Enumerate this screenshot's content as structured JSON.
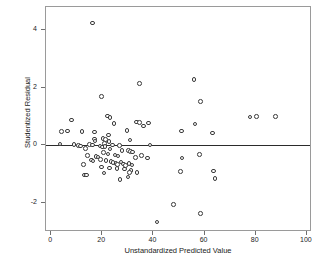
{
  "chart_data": {
    "type": "scatter",
    "title": "",
    "xlabel": "Unstandardized Predicted Value",
    "ylabel": "Studentized Residual",
    "xlim": [
      -2,
      102
    ],
    "ylim": [
      -3.0,
      4.8
    ],
    "xticks": [
      0,
      20,
      40,
      60,
      80,
      100
    ],
    "xtick_labels": [
      "0",
      "20",
      "40",
      "60",
      "80",
      "100"
    ],
    "yticks": [
      4,
      2,
      0,
      -2
    ],
    "ytick_labels": [
      "4",
      "2",
      "0",
      "-2"
    ],
    "grid": false,
    "legend": false,
    "reference_line": {
      "orientation": "horizontal",
      "y": 0
    },
    "marker": {
      "shape": "circle",
      "filled": false,
      "edge_color": "#3a3a3a",
      "size": 4.6
    },
    "frame_color": "#9a9a9a",
    "points": [
      [
        16.2,
        4.25
      ],
      [
        34.6,
        2.14
      ],
      [
        55.8,
        2.28
      ],
      [
        19.6,
        1.69
      ],
      [
        58.4,
        1.53
      ],
      [
        22.1,
        1.02
      ],
      [
        23.0,
        0.97
      ],
      [
        24.6,
        0.77
      ],
      [
        77.8,
        0.98
      ],
      [
        80.2,
        1.0
      ],
      [
        87.8,
        1.0
      ],
      [
        7.9,
        0.88
      ],
      [
        33.4,
        0.82
      ],
      [
        34.6,
        0.8
      ],
      [
        38.1,
        0.78
      ],
      [
        36.2,
        0.68
      ],
      [
        56.2,
        0.74
      ],
      [
        4.0,
        0.48
      ],
      [
        6.4,
        0.5
      ],
      [
        12.1,
        0.48
      ],
      [
        17.0,
        0.46
      ],
      [
        29.7,
        0.51
      ],
      [
        51.0,
        0.5
      ],
      [
        63.2,
        0.43
      ],
      [
        22.4,
        0.36
      ],
      [
        16.9,
        0.22
      ],
      [
        20.3,
        0.24
      ],
      [
        21.2,
        0.2
      ],
      [
        22.6,
        0.14
      ],
      [
        30.9,
        0.19
      ],
      [
        17.2,
        0.16
      ],
      [
        20.9,
        0.07
      ],
      [
        3.4,
        0.05
      ],
      [
        8.9,
        0.03
      ],
      [
        10.6,
        0.0
      ],
      [
        11.4,
        -0.02
      ],
      [
        14.9,
        0.04
      ],
      [
        16.1,
        0.02
      ],
      [
        19.1,
        -0.02
      ],
      [
        20.2,
        -0.05
      ],
      [
        21.0,
        -0.04
      ],
      [
        24.0,
        0.01
      ],
      [
        26.8,
        0.0
      ],
      [
        38.6,
        0.01
      ],
      [
        13.4,
        -0.1
      ],
      [
        23.1,
        -0.12
      ],
      [
        27.7,
        -0.18
      ],
      [
        30.2,
        -0.17
      ],
      [
        31.0,
        -0.2
      ],
      [
        31.8,
        -0.22
      ],
      [
        20.4,
        -0.25
      ],
      [
        22.2,
        -0.3
      ],
      [
        25.0,
        -0.33
      ],
      [
        26.2,
        -0.36
      ],
      [
        14.2,
        -0.34
      ],
      [
        17.6,
        -0.38
      ],
      [
        18.4,
        -0.4
      ],
      [
        33.0,
        -0.41
      ],
      [
        35.4,
        -0.35
      ],
      [
        37.8,
        -0.44
      ],
      [
        51.1,
        -0.44
      ],
      [
        58.0,
        -0.32
      ],
      [
        12.6,
        -0.66
      ],
      [
        15.8,
        -0.5
      ],
      [
        16.4,
        -0.54
      ],
      [
        19.2,
        -0.48
      ],
      [
        21.4,
        -0.52
      ],
      [
        23.4,
        -0.55
      ],
      [
        24.2,
        -0.6
      ],
      [
        25.4,
        -0.62
      ],
      [
        26.0,
        -0.66
      ],
      [
        27.4,
        -0.58
      ],
      [
        28.2,
        -0.64
      ],
      [
        29.0,
        -0.7
      ],
      [
        30.4,
        -0.63
      ],
      [
        31.6,
        -0.68
      ],
      [
        19.8,
        -0.74
      ],
      [
        22.8,
        -0.78
      ],
      [
        25.8,
        -0.8
      ],
      [
        28.8,
        -0.82
      ],
      [
        31.2,
        -0.86
      ],
      [
        20.6,
        -0.95
      ],
      [
        13.0,
        -1.02
      ],
      [
        13.9,
        -1.03
      ],
      [
        30.6,
        -0.94
      ],
      [
        33.6,
        -0.94
      ],
      [
        50.6,
        -0.9
      ],
      [
        63.4,
        -0.88
      ],
      [
        27.0,
        -1.18
      ],
      [
        30.0,
        -1.1
      ],
      [
        64.0,
        -1.15
      ],
      [
        47.9,
        -2.05
      ],
      [
        58.5,
        -2.36
      ],
      [
        41.4,
        -2.66
      ]
    ]
  }
}
